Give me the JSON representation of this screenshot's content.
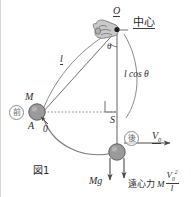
{
  "figure": {
    "caption": "図1",
    "pivot_label": "O",
    "center_label": "中心",
    "angle_label": "θ",
    "string_label": "l",
    "vertical_component_label": "l cos θ",
    "foot_label": "S",
    "mass_label": "M",
    "start_point_label": "A",
    "initial_speed_label": "0",
    "state_before": "前",
    "state_after": "後",
    "velocity_label": "V",
    "velocity_subscript": "0",
    "weight_label": "Mg",
    "centrifugal_text": "遠心力",
    "centrifugal_mass": "M",
    "centrifugal_numerator_base": "V",
    "centrifugal_numerator_sub": "0",
    "centrifugal_numerator_sup": "2",
    "centrifugal_denominator": "l"
  },
  "colors": {
    "ink": "#2b2b2b",
    "line": "#6f6f6f",
    "ball_fill": "#9a9a9a",
    "ball_stroke": "#5e5e5e",
    "hand_fill": "#c9c9c9",
    "hand_stroke": "#7a7a7a",
    "dotted": "#8a8a8a",
    "background": "#ffffff"
  }
}
